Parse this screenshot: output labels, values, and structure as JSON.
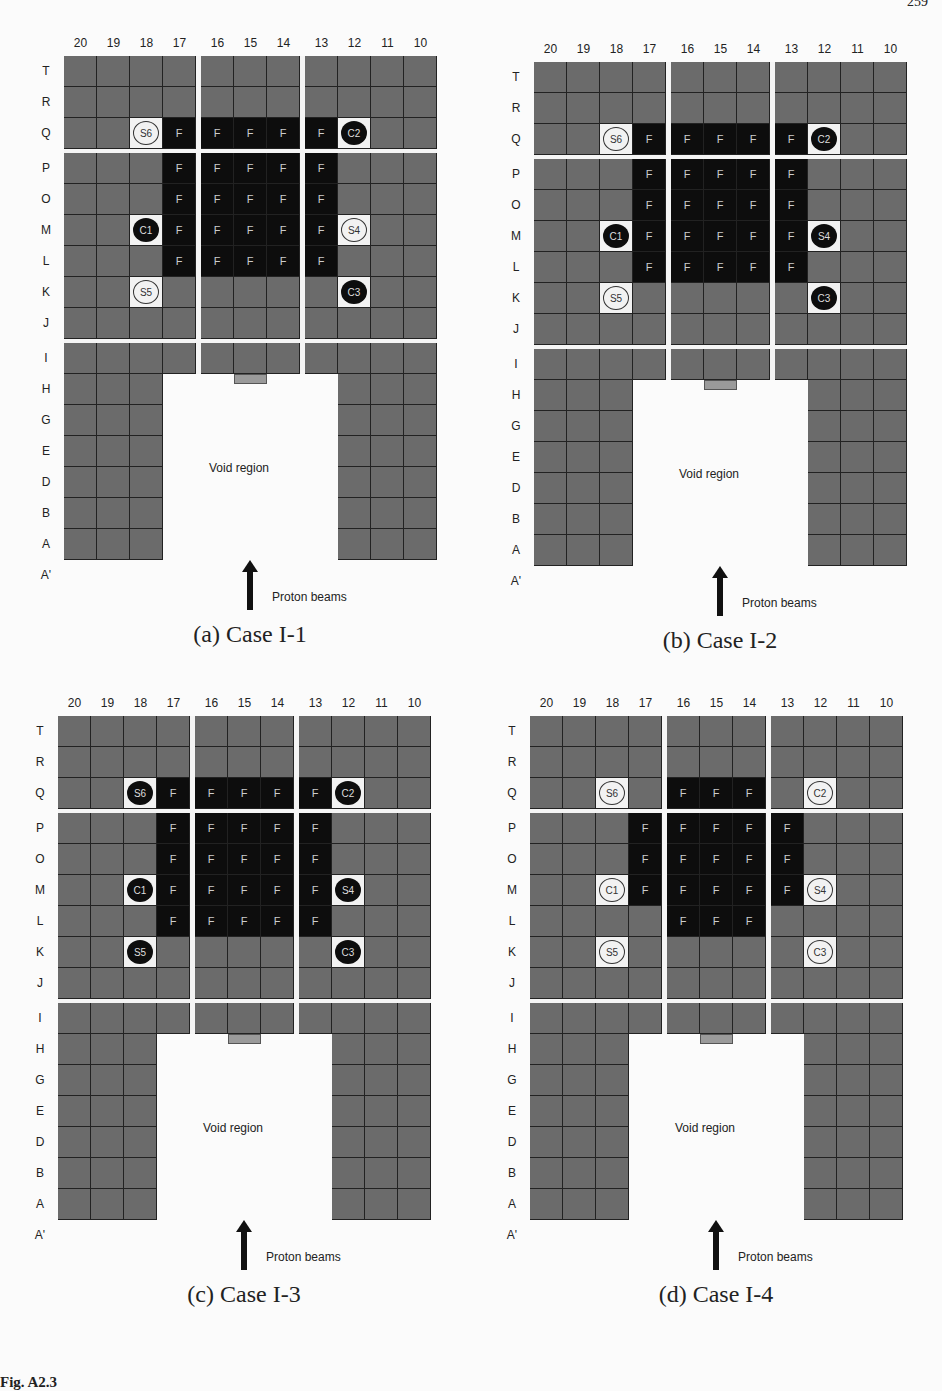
{
  "page_number": "259",
  "figure_caption": "Fig. A2.3",
  "layout": {
    "columns": [
      "20",
      "19",
      "18",
      "17",
      "16",
      "15",
      "14",
      "13",
      "12",
      "11",
      "10"
    ],
    "rows": [
      "T",
      "R",
      "Q",
      "P",
      "O",
      "M",
      "L",
      "K",
      "J",
      "I",
      "H",
      "G",
      "E",
      "D",
      "B",
      "A",
      "A'"
    ],
    "full_rows": [
      "T",
      "R",
      "Q",
      "P",
      "O",
      "M",
      "L",
      "K",
      "J",
      "I"
    ],
    "leg_rows": [
      "H",
      "G",
      "E",
      "D",
      "B",
      "A"
    ],
    "left_leg_columns": [
      "20",
      "19",
      "18"
    ],
    "right_leg_columns": [
      "12",
      "11",
      "10"
    ],
    "void_label": "Void region",
    "beam_label": "Proton beams"
  },
  "panels": [
    {
      "id": "a",
      "caption": "(a) Case I-1",
      "fuel": {
        "Q": [
          "17",
          "16",
          "15",
          "14",
          "13"
        ],
        "P": [
          "17",
          "16",
          "15",
          "14",
          "13"
        ],
        "O": [
          "17",
          "16",
          "15",
          "14",
          "13"
        ],
        "M": [
          "17",
          "16",
          "15",
          "14",
          "13"
        ],
        "L": [
          "17",
          "16",
          "15",
          "14",
          "13"
        ]
      },
      "positions": [
        {
          "label": "S6",
          "row": "Q",
          "col": "18",
          "fill": "white"
        },
        {
          "label": "C2",
          "row": "Q",
          "col": "12",
          "fill": "black"
        },
        {
          "label": "C1",
          "row": "M",
          "col": "18",
          "fill": "black"
        },
        {
          "label": "S4",
          "row": "M",
          "col": "12",
          "fill": "white"
        },
        {
          "label": "S5",
          "row": "K",
          "col": "18",
          "fill": "white"
        },
        {
          "label": "C3",
          "row": "K",
          "col": "12",
          "fill": "black"
        }
      ]
    },
    {
      "id": "b",
      "caption": "(b) Case I-2",
      "fuel": {
        "Q": [
          "17",
          "16",
          "15",
          "14",
          "13"
        ],
        "P": [
          "17",
          "16",
          "15",
          "14",
          "13"
        ],
        "O": [
          "17",
          "16",
          "15",
          "14",
          "13"
        ],
        "M": [
          "17",
          "16",
          "15",
          "14",
          "13"
        ],
        "L": [
          "17",
          "16",
          "15",
          "14",
          "13"
        ]
      },
      "positions": [
        {
          "label": "S6",
          "row": "Q",
          "col": "18",
          "fill": "white"
        },
        {
          "label": "C2",
          "row": "Q",
          "col": "12",
          "fill": "black"
        },
        {
          "label": "C1",
          "row": "M",
          "col": "18",
          "fill": "black"
        },
        {
          "label": "S4",
          "row": "M",
          "col": "12",
          "fill": "black"
        },
        {
          "label": "S5",
          "row": "K",
          "col": "18",
          "fill": "white"
        },
        {
          "label": "C3",
          "row": "K",
          "col": "12",
          "fill": "black"
        }
      ]
    },
    {
      "id": "c",
      "caption": "(c) Case I-3",
      "fuel": {
        "Q": [
          "17",
          "16",
          "15",
          "14",
          "13"
        ],
        "P": [
          "17",
          "16",
          "15",
          "14",
          "13"
        ],
        "O": [
          "17",
          "16",
          "15",
          "14",
          "13"
        ],
        "M": [
          "17",
          "16",
          "15",
          "14",
          "13"
        ],
        "L": [
          "17",
          "16",
          "15",
          "14",
          "13"
        ]
      },
      "positions": [
        {
          "label": "S6",
          "row": "Q",
          "col": "18",
          "fill": "black"
        },
        {
          "label": "C2",
          "row": "Q",
          "col": "12",
          "fill": "black"
        },
        {
          "label": "C1",
          "row": "M",
          "col": "18",
          "fill": "black"
        },
        {
          "label": "S4",
          "row": "M",
          "col": "12",
          "fill": "black"
        },
        {
          "label": "S5",
          "row": "K",
          "col": "18",
          "fill": "black"
        },
        {
          "label": "C3",
          "row": "K",
          "col": "12",
          "fill": "black"
        }
      ]
    },
    {
      "id": "d",
      "caption": "(d) Case I-4",
      "fuel": {
        "Q": [
          "16",
          "15",
          "14"
        ],
        "P": [
          "17",
          "16",
          "15",
          "14",
          "13"
        ],
        "O": [
          "17",
          "16",
          "15",
          "14",
          "13"
        ],
        "M": [
          "17",
          "16",
          "15",
          "14",
          "13"
        ],
        "L": [
          "16",
          "15",
          "14"
        ]
      },
      "positions": [
        {
          "label": "S6",
          "row": "Q",
          "col": "18",
          "fill": "white"
        },
        {
          "label": "C2",
          "row": "Q",
          "col": "12",
          "fill": "white"
        },
        {
          "label": "C1",
          "row": "M",
          "col": "18",
          "fill": "white"
        },
        {
          "label": "S4",
          "row": "M",
          "col": "12",
          "fill": "white"
        },
        {
          "label": "S5",
          "row": "K",
          "col": "18",
          "fill": "white"
        },
        {
          "label": "C3",
          "row": "K",
          "col": "12",
          "fill": "white"
        }
      ]
    }
  ]
}
